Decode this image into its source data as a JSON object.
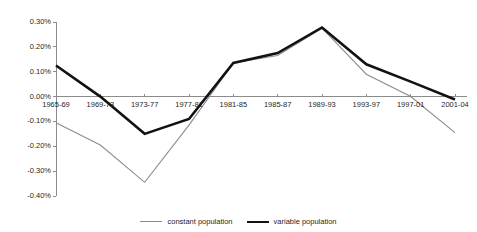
{
  "chart_data": {
    "type": "line",
    "title": "",
    "subtitle": "",
    "xlabel": "",
    "ylabel": "",
    "categories": [
      "1965-69",
      "1969-73",
      "1973-77",
      "1977-81",
      "1981-85",
      "1985-87",
      "1989-93",
      "1993-97",
      "1997-01",
      "2001-04"
    ],
    "series": [
      {
        "name": "constant population",
        "color": "#8c8c8c",
        "line_width": 1.1,
        "values": [
          -0.105,
          -0.195,
          -0.345,
          -0.115,
          0.135,
          0.165,
          0.275,
          0.09,
          0.0,
          -0.145
        ]
      },
      {
        "name": "variable population",
        "color": "#121212",
        "line_width": 2.6,
        "values": [
          0.125,
          0.0,
          -0.15,
          -0.09,
          0.135,
          0.175,
          0.278,
          0.13,
          0.06,
          -0.012
        ]
      }
    ],
    "ylim": [
      -0.4,
      0.3
    ],
    "ytick_values": [
      0.3,
      0.2,
      0.1,
      0.0,
      -0.1,
      -0.2,
      -0.3,
      -0.4
    ],
    "ytick_labels": [
      "0.30%",
      "0.20%",
      "0.10%",
      "0.00%",
      "-0.10%",
      "-0.20%",
      "-0.30%",
      "-0.40%"
    ],
    "grid": false,
    "legend_position": "bottom-center",
    "axis_color": "#8c8c8c",
    "zero_line_value": 0.0
  },
  "legend": {
    "entries": [
      {
        "label": "constant population"
      },
      {
        "label": "variable population"
      }
    ]
  }
}
